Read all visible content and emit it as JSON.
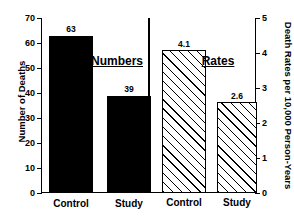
{
  "chart_data": {
    "type": "bar",
    "title": "",
    "panels": [
      {
        "name": "numbers-panel",
        "title": "Numbers",
        "axis": "left",
        "categories": [
          "Control",
          "Study"
        ],
        "values": [
          63,
          39
        ],
        "value_labels": [
          "63",
          "39"
        ],
        "style": "solid-black"
      },
      {
        "name": "rates-panel",
        "title": "Rates",
        "axis": "right",
        "categories": [
          "Control",
          "Study"
        ],
        "values": [
          4.1,
          2.6
        ],
        "value_labels": [
          "4.1",
          "2.6"
        ],
        "style": "diagonal-hatch"
      }
    ],
    "left_axis": {
      "label": "Number of Deaths",
      "ylim": [
        0,
        70
      ],
      "ticks": [
        0,
        10,
        20,
        30,
        40,
        50,
        60,
        70
      ],
      "ticklabels": [
        "0",
        "10",
        "20",
        "30",
        "40",
        "50",
        "60",
        "70"
      ]
    },
    "right_axis": {
      "label": "Death Rates per 10,000 Person-Years",
      "ylim": [
        0,
        5
      ],
      "ticks": [
        0,
        1,
        2,
        3,
        4,
        5
      ],
      "ticklabels": [
        "0",
        "1",
        "2",
        "3",
        "4",
        "5"
      ]
    },
    "xlabel": "",
    "grid": false,
    "legend": "none",
    "colors": {
      "bar_solid": "#000000",
      "bar_hatch_line": "#000000",
      "bar_hatch_fill": "#ffffff",
      "axis": "#000000",
      "background": "#ffffff"
    }
  }
}
